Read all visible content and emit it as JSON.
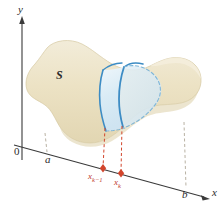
{
  "figure": {
    "kind": "math-diagram",
    "background": "#ffffff"
  },
  "axes": {
    "y_axis_label": "y",
    "x_axis_label": "x",
    "origin_label": "0",
    "axis_color": "#3a3a3a"
  },
  "labels": {
    "solid": "S",
    "left_bound": "a",
    "right_bound": "b",
    "slab_left_base": "x",
    "slab_left_sub": "k−1",
    "slab_right_base": "x",
    "slab_right_sub": "k"
  },
  "colors": {
    "solid_fill": "#ece3c6",
    "solid_fill_light": "#f3ecd8",
    "solid_edge": "#d8cda6",
    "slab_fill": "#d8eaf4",
    "slab_fill_light": "#eaf4fa",
    "slab_stroke": "#3d8cc4",
    "slab_dashed": "#7fb6d8",
    "marker_red": "#d2452c",
    "dashed_red": "#d2452c",
    "dashed_gray": "#b9b2a4",
    "text": "#2b2b2b"
  },
  "markers": {
    "point_count": 2,
    "point_shape": "diamond"
  }
}
